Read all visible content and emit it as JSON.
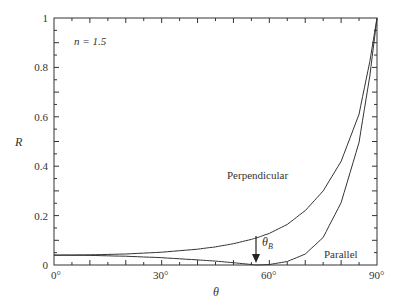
{
  "chart_data": {
    "type": "line",
    "title": "",
    "xlabel": "θ",
    "ylabel": "R",
    "xlim": [
      0,
      90
    ],
    "ylim": [
      0,
      1
    ],
    "grid": false,
    "legend": "inline curve labels",
    "x_ticks": [
      "0°",
      "30°",
      "60°",
      "90°"
    ],
    "y_ticks": [
      "0",
      "0.2",
      "0.4",
      "0.6",
      "0.8",
      "1"
    ],
    "annotations": {
      "parameter": "n = 1.5",
      "brewster_label": "θB",
      "brewster_angle": 56.3
    },
    "x": [
      0,
      10,
      20,
      30,
      40,
      45,
      50,
      55,
      56.3,
      60,
      65,
      70,
      75,
      80,
      85,
      88,
      90
    ],
    "series": [
      {
        "name": "Perpendicular",
        "values": [
          0.04,
          0.0411,
          0.0447,
          0.0517,
          0.0641,
          0.0734,
          0.0862,
          0.1038,
          0.109,
          0.128,
          0.1644,
          0.22,
          0.3,
          0.4193,
          0.6108,
          0.8234,
          1.0
        ]
      },
      {
        "name": "Parallel",
        "values": [
          0.04,
          0.0389,
          0.0355,
          0.0296,
          0.0207,
          0.0158,
          0.0093,
          0.0021,
          0.0,
          0.0018,
          0.0143,
          0.0441,
          0.1117,
          0.2522,
          0.497,
          0.7649,
          1.0
        ]
      }
    ]
  },
  "labels": {
    "n": "n = 1.5",
    "ylabel": "R",
    "xlabel": "θ",
    "perpendicular": "Perpendicular",
    "parallel": "Parallel",
    "theta_b_main": "θ",
    "theta_b_sub": "B",
    "x0": "0°",
    "x30": "30°",
    "x60": "60°",
    "x90": "90°",
    "y0": "0",
    "y02": "0.2",
    "y04": "0.4",
    "y06": "0.6",
    "y08": "0.8",
    "y1": "1"
  }
}
